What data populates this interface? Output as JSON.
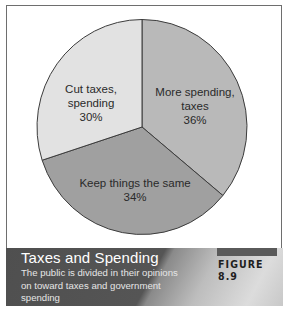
{
  "chart_data": {
    "type": "pie",
    "title": "Taxes and Spending",
    "subtitle": "The public is divided in their opinions on toward taxes and government spending",
    "figure_label": "FIGURE 8.9",
    "categories": [
      "More spending, taxes",
      "Keep things the same",
      "Cut taxes, spending"
    ],
    "values": [
      36,
      34,
      30
    ],
    "unit": "%",
    "colors": [
      "#b9b9b9",
      "#a0a0a0",
      "#e2e2e2"
    ],
    "start_angle_deg": 0,
    "direction": "clockwise-from-top",
    "legend": "none (labels inside slices)"
  },
  "slices": [
    {
      "label_line1": "More spending,",
      "label_line2": "taxes",
      "pct": "36%"
    },
    {
      "label_line1": "Keep things the same",
      "label_line2": "",
      "pct": "34%"
    },
    {
      "label_line1": "Cut taxes,",
      "label_line2": "spending",
      "pct": "30%"
    }
  ],
  "caption": {
    "title": "Taxes and Spending",
    "description": "The public is divided in their opinions on toward taxes and government spending",
    "figure": "FIGURE 8.9"
  }
}
